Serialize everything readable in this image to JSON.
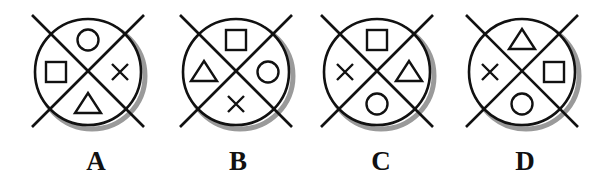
{
  "figures": [
    {
      "label": "A",
      "cx": 88,
      "top": "circle",
      "right": "cross",
      "bottom": "triangle",
      "left": "square"
    },
    {
      "label": "B",
      "cx": 236,
      "top": "square",
      "right": "circle",
      "bottom": "cross",
      "left": "triangle"
    },
    {
      "label": "C",
      "cx": 377,
      "top": "square",
      "right": "triangle",
      "bottom": "circle",
      "left": "cross"
    },
    {
      "label": "D",
      "cx": 522,
      "top": "triangle",
      "right": "square",
      "bottom": "circle",
      "left": "cross"
    }
  ],
  "colors": {
    "stroke": "#111111",
    "shadow": "#9a9a9a",
    "background": "#ffffff"
  }
}
